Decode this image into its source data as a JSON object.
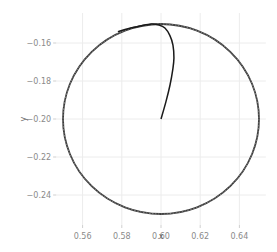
{
  "chart_data": {
    "type": "line",
    "title": "",
    "xlabel": "x",
    "ylabel": "y",
    "xlim": [
      0.5465,
      0.6535
    ],
    "ylim": [
      -0.2558,
      -0.1442
    ],
    "grid": true,
    "legend": null,
    "x_ticks": [
      0.56,
      0.58,
      0.6,
      0.62,
      0.64
    ],
    "x_tick_labels": [
      "0.56",
      "0.58",
      "0.60",
      "0.62",
      "0.64"
    ],
    "y_ticks": [
      -0.16,
      -0.18,
      -0.2,
      -0.22,
      -0.24
    ],
    "y_tick_labels": [
      "−0.16",
      "−0.18",
      "−0.20",
      "−0.22",
      "−0.24"
    ],
    "series": [
      {
        "name": "circle",
        "style": "dashed-dark",
        "color": "#3a3a3a",
        "shape": "circle",
        "center": [
          0.6,
          -0.2
        ],
        "radius": 0.05
      },
      {
        "name": "trajectory",
        "style": "solid",
        "color": "#1a1a1a",
        "x": [
          0.6,
          0.6025,
          0.6046,
          0.606,
          0.6066,
          0.6061,
          0.6045,
          0.602,
          0.599,
          0.595,
          0.5893,
          0.584,
          0.578
        ],
        "y": [
          -0.2,
          -0.191,
          -0.1821,
          -0.174,
          -0.1679,
          -0.1611,
          -0.156,
          -0.1521,
          -0.1505,
          -0.15,
          -0.1511,
          -0.1522,
          -0.154
        ]
      }
    ]
  }
}
